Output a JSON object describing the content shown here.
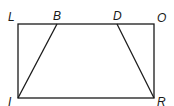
{
  "diagram": {
    "type": "geometry",
    "shape": "rectangle with inscribed trapezoid",
    "stroke_color": "#1a1a1a",
    "points": {
      "L": {
        "label": "L",
        "x": 18,
        "y": 24
      },
      "B": {
        "label": "B",
        "x": 57,
        "y": 24
      },
      "D": {
        "label": "D",
        "x": 117,
        "y": 24
      },
      "O": {
        "label": "O",
        "x": 154,
        "y": 24
      },
      "I": {
        "label": "I",
        "x": 18,
        "y": 98
      },
      "R": {
        "label": "R",
        "x": 154,
        "y": 98
      }
    },
    "segments": [
      "LO",
      "OR",
      "RI",
      "IL",
      "IB",
      "DR"
    ]
  }
}
